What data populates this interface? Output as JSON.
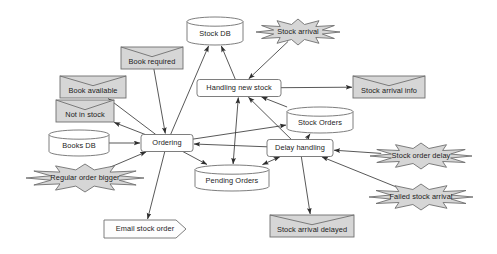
{
  "diagram": {
    "style": {
      "stroke": "#6f6f6f",
      "process_fill": "#ffffff",
      "store_fill": "#ffffff",
      "event_fill": "#d6d6d6",
      "burst_fill": "#d6d6d6",
      "text": "#1b1b1b"
    },
    "nodes": [
      {
        "id": "stock_db",
        "label": "Stock DB",
        "shape": "cylinder",
        "cx": 215,
        "cy": 31,
        "w": 56,
        "h": 28
      },
      {
        "id": "stock_arrival",
        "label": "Stock arrival",
        "shape": "burst",
        "cx": 298,
        "cy": 32,
        "w": 84,
        "h": 26
      },
      {
        "id": "book_required",
        "label": "Book required",
        "shape": "envelope",
        "cx": 152,
        "cy": 58,
        "w": 62,
        "h": 22
      },
      {
        "id": "handling_new_stock",
        "label": "Handling new stock",
        "shape": "process",
        "cx": 239,
        "cy": 88,
        "w": 84,
        "h": 17
      },
      {
        "id": "stock_arrival_info",
        "label": "Stock arrival info",
        "shape": "envelope",
        "cx": 389,
        "cy": 87,
        "w": 72,
        "h": 22
      },
      {
        "id": "book_available",
        "label": "Book available",
        "shape": "envelope",
        "cx": 93,
        "cy": 87,
        "w": 66,
        "h": 22
      },
      {
        "id": "not_in_stock",
        "label": "Not in stock",
        "shape": "envelope",
        "cx": 85,
        "cy": 111,
        "w": 58,
        "h": 22
      },
      {
        "id": "stock_orders",
        "label": "Stock Orders",
        "shape": "cylinder",
        "cx": 320,
        "cy": 120,
        "w": 66,
        "h": 26
      },
      {
        "id": "books_db",
        "label": "Books DB",
        "shape": "cylinder",
        "cx": 79,
        "cy": 143,
        "w": 60,
        "h": 26
      },
      {
        "id": "ordering",
        "label": "Ordering",
        "shape": "process",
        "cx": 167,
        "cy": 143,
        "w": 52,
        "h": 17
      },
      {
        "id": "delay_handling",
        "label": "Delay handling",
        "shape": "process",
        "cx": 300,
        "cy": 148,
        "w": 66,
        "h": 17
      },
      {
        "id": "stock_order_delay",
        "label": "Stock order delay",
        "shape": "burst",
        "cx": 421,
        "cy": 156,
        "w": 102,
        "h": 26
      },
      {
        "id": "pending_orders",
        "label": "Pending Orders",
        "shape": "cylinder",
        "cx": 232,
        "cy": 178,
        "w": 74,
        "h": 26
      },
      {
        "id": "regular_order",
        "label": "Regular order bigger",
        "shape": "burst",
        "cx": 85,
        "cy": 178,
        "w": 118,
        "h": 28
      },
      {
        "id": "failed_stock",
        "label": "Failed stock arrival",
        "shape": "burst",
        "cx": 421,
        "cy": 197,
        "w": 104,
        "h": 26
      },
      {
        "id": "stock_arr_delayed",
        "label": "Stock arrival delayed",
        "shape": "envelope",
        "cx": 312,
        "cy": 226,
        "w": 84,
        "h": 22
      },
      {
        "id": "email_stock_order",
        "label": "Email stock order",
        "shape": "pentagon",
        "cx": 145,
        "cy": 229,
        "w": 82,
        "h": 18
      }
    ],
    "edges": [
      {
        "from": "handling_new_stock",
        "to": "stock_db",
        "arrow": "end"
      },
      {
        "from": "stock_arrival",
        "to": "handling_new_stock",
        "arrow": "end"
      },
      {
        "from": "ordering",
        "to": "stock_db",
        "arrow": "end"
      },
      {
        "from": "book_required",
        "to": "ordering",
        "arrow": "end"
      },
      {
        "from": "ordering",
        "to": "book_available",
        "arrow": "end"
      },
      {
        "from": "ordering",
        "to": "not_in_stock",
        "arrow": "end"
      },
      {
        "from": "books_db",
        "to": "ordering",
        "arrow": "end"
      },
      {
        "from": "regular_order",
        "to": "ordering",
        "arrow": "end"
      },
      {
        "from": "ordering",
        "to": "email_stock_order",
        "arrow": "end"
      },
      {
        "from": "ordering",
        "to": "pending_orders",
        "arrow": "end"
      },
      {
        "from": "ordering",
        "to": "stock_orders",
        "arrow": "end"
      },
      {
        "from": "handling_new_stock",
        "to": "stock_arrival_info",
        "arrow": "end"
      },
      {
        "from": "handling_new_stock",
        "to": "pending_orders",
        "arrow": "both"
      },
      {
        "from": "stock_orders",
        "to": "handling_new_stock",
        "arrow": "end"
      },
      {
        "from": "delay_handling",
        "to": "handling_new_stock",
        "arrow": "end"
      },
      {
        "from": "delay_handling",
        "to": "stock_orders",
        "arrow": "end"
      },
      {
        "from": "delay_handling",
        "to": "pending_orders",
        "arrow": "both"
      },
      {
        "from": "delay_handling",
        "to": "ordering",
        "arrow": "end"
      },
      {
        "from": "stock_order_delay",
        "to": "delay_handling",
        "arrow": "end"
      },
      {
        "from": "failed_stock",
        "to": "delay_handling",
        "arrow": "end"
      },
      {
        "from": "delay_handling",
        "to": "stock_arr_delayed",
        "arrow": "end"
      }
    ]
  }
}
